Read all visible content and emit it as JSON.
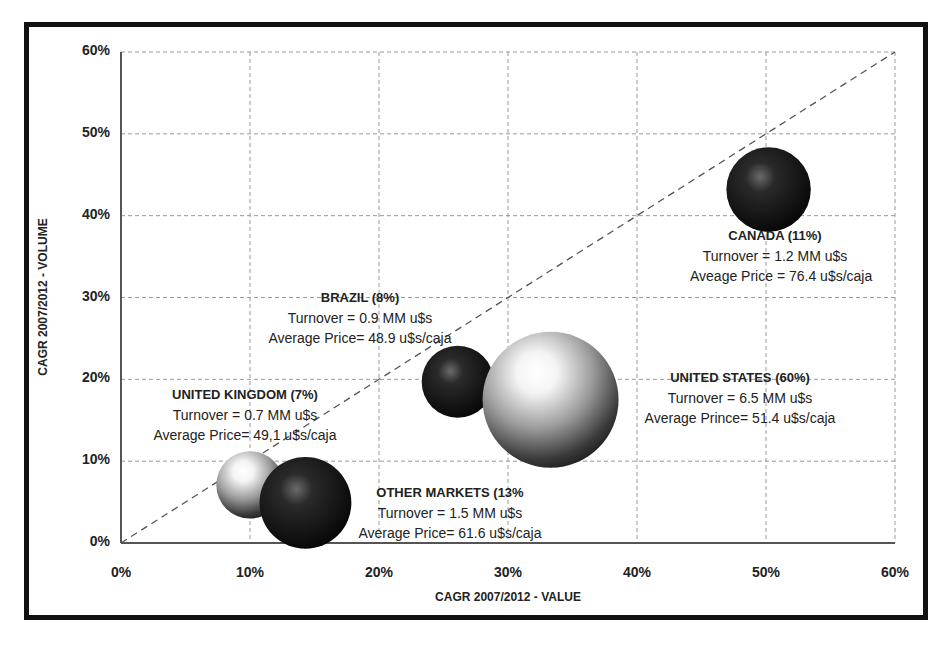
{
  "chart_data": {
    "type": "bubble",
    "title": "",
    "xlabel": "CAGR 2007/2012 - VALUE",
    "ylabel": "CAGR 2007/2012 - VOLUME",
    "xlim": [
      0,
      60
    ],
    "ylim": [
      0,
      60
    ],
    "x_ticks": [
      "0%",
      "10%",
      "20%",
      "30%",
      "40%",
      "50%",
      "60%"
    ],
    "y_ticks": [
      "0%",
      "10%",
      "20%",
      "30%",
      "40%",
      "50%",
      "60%"
    ],
    "grid": true,
    "reference_line": {
      "from": [
        0,
        0
      ],
      "to": [
        60,
        60
      ],
      "style": "dashed"
    },
    "series": [
      {
        "name": "CANADA",
        "share": "11%",
        "x": 50.2,
        "y": 43.2,
        "size": 11,
        "turnover": "1.2 MM u$s",
        "avg_price": "76.4 u$s/caja",
        "color": "dark"
      },
      {
        "name": "BRAZIL",
        "share": "8%",
        "x": 26.1,
        "y": 19.7,
        "size": 8,
        "turnover": "0.9 MM u$s",
        "avg_price": "48.9 u$s/caja",
        "color": "dark"
      },
      {
        "name": "UNITED STATES",
        "share": "60%",
        "x": 33.3,
        "y": 17.5,
        "size": 60,
        "turnover": "6.5 MM u$s",
        "avg_price": "51.4 u$s/caja",
        "color": "light"
      },
      {
        "name": "UNITED KINGDOM",
        "share": "7%",
        "x": 10.0,
        "y": 7.1,
        "size": 7,
        "turnover": "0.7 MM u$s",
        "avg_price": "49,1 u$s/caja",
        "color": "light"
      },
      {
        "name": "OTHER MARKETS",
        "share": "13%",
        "x": 14.3,
        "y": 4.9,
        "size": 13,
        "turnover": "1.5 MM u$s",
        "avg_price": "61.6 u$s/caja",
        "color": "dark"
      }
    ]
  },
  "labels": {
    "canada": {
      "title": "CANADA (11%)",
      "line1": "Turnover = 1.2 MM u$s",
      "line2": "Aveage Price = 76.4 u$s/caja"
    },
    "brazil": {
      "title": "BRAZIL (8%)",
      "line1": "Turnover = 0.9 MM u$s",
      "line2": "Average Price= 48.9 u$s/caja"
    },
    "us": {
      "title": "UNITED STATES (60%)",
      "line1": "Turnover = 6.5 MM u$s",
      "line2": "Average Prince= 51.4 u$s/caja"
    },
    "uk": {
      "title": "UNITED KINGDOM (7%)",
      "line1": "Turnover = 0.7 MM u$s",
      "line2": "Average Price= 49,1 u$s/caja"
    },
    "other": {
      "title": "OTHER MARKETS (13%",
      "line1": "Turnover = 1.5 MM u$s",
      "line2": "Average Price= 61.6 u$s/caja"
    }
  }
}
